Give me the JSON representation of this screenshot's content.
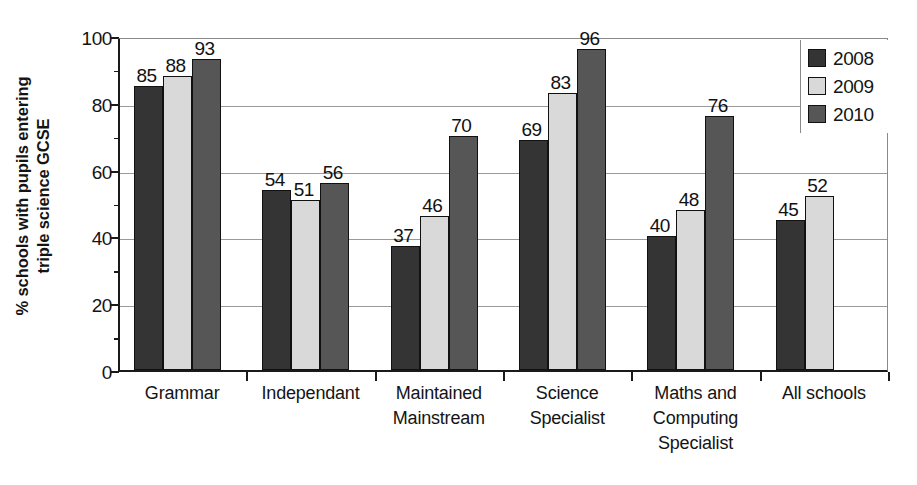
{
  "chart_data": {
    "type": "bar",
    "title": "",
    "xlabel": "",
    "ylabel": "% schools with pupils entering triple science GCSE",
    "ylabel_line1": "% schools with pupils entering",
    "ylabel_line2": "triple science GCSE",
    "ylim": [
      0,
      100
    ],
    "ytick_labels": [
      "0",
      "20",
      "40",
      "60",
      "80",
      "100"
    ],
    "ytick_values": [
      0,
      20,
      40,
      60,
      80,
      100
    ],
    "yminor_values": [
      10,
      30,
      50,
      70,
      90
    ],
    "grid": "horizontal",
    "legend_position": "top-right",
    "categories": [
      "Grammar",
      "Independant",
      "Maintained Mainstream",
      "Science Specialist",
      "Maths and Computing Specialist",
      "All schools"
    ],
    "category_label_lines": [
      [
        "Grammar"
      ],
      [
        "Independant"
      ],
      [
        "Maintained",
        "Mainstream"
      ],
      [
        "Science",
        "Specialist"
      ],
      [
        "Maths and",
        "Computing",
        "Specialist"
      ],
      [
        "All schools"
      ]
    ],
    "series": [
      {
        "name": "2008",
        "color": "#343434",
        "values": [
          85,
          54,
          37,
          69,
          40,
          45
        ]
      },
      {
        "name": "2009",
        "color": "#d9d9d9",
        "values": [
          88,
          51,
          46,
          83,
          48,
          52
        ]
      },
      {
        "name": "2010",
        "color": "#565656",
        "values": [
          93,
          56,
          70,
          96,
          76,
          null
        ]
      }
    ]
  },
  "legend": {
    "entries": [
      {
        "label": "2008",
        "color": "#343434"
      },
      {
        "label": "2009",
        "color": "#d9d9d9"
      },
      {
        "label": "2010",
        "color": "#565656"
      }
    ]
  }
}
